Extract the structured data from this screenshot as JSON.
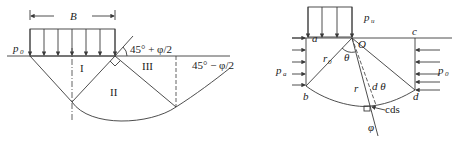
{
  "left_figure": {
    "width_label": "B",
    "surcharge_label": "p",
    "surcharge_subscript": "0",
    "zone_labels": [
      "I",
      "II",
      "III"
    ],
    "angle_top": "45° + φ/2",
    "angle_right": "45° − φ/2"
  },
  "right_figure": {
    "load_label": "p",
    "load_subscript": "u",
    "left_pressure": "p",
    "left_pressure_sub": "a",
    "right_pressure": "p",
    "right_pressure_sub": "0",
    "points": {
      "a": "a",
      "b": "b",
      "c": "c",
      "d": "d",
      "O": "O"
    },
    "radius0": "r",
    "radius0_sub": "0",
    "radius": "r",
    "theta": "θ",
    "dtheta": "d θ",
    "cds": "cds",
    "phi": "φ"
  }
}
